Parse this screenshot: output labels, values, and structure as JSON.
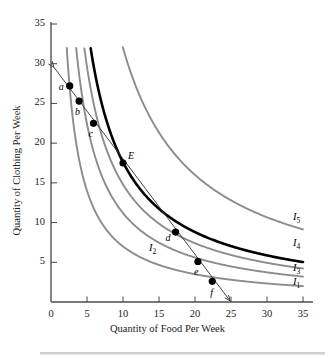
{
  "chart_data": {
    "type": "line",
    "title": "",
    "xlabel": "Quantity of Food Per Week",
    "ylabel": "Quantity of Clothing Per Week",
    "xlim": [
      0,
      35
    ],
    "ylim": [
      0,
      35
    ],
    "xticks": [
      0,
      5,
      10,
      15,
      20,
      25,
      30,
      35
    ],
    "yticks": [
      5,
      10,
      15,
      20,
      25,
      30,
      35
    ],
    "grid": false,
    "legend_position": "right-inline",
    "series": [
      {
        "name": "I1",
        "label": "I",
        "subscript": "1",
        "color": "#8c8c8c",
        "style": "solid",
        "width": 1.9,
        "utility_k": 70,
        "label_x": 33.6,
        "label_y": 2.3
      },
      {
        "name": "I2",
        "label": "I",
        "subscript": "2",
        "color": "#8c8c8c",
        "style": "solid",
        "width": 1.9,
        "utility_k": 112,
        "label_x": 13.6,
        "label_y": 6.6
      },
      {
        "name": "I3",
        "label": "I",
        "subscript": "3",
        "color": "#8c8c8c",
        "style": "solid",
        "width": 1.9,
        "utility_k": 148,
        "label_x": 33.6,
        "label_y": 4.0
      },
      {
        "name": "I4",
        "label": "I",
        "subscript": "4",
        "color": "#000000",
        "style": "solid",
        "width": 2.6,
        "utility_k": 176,
        "label_x": 33.6,
        "label_y": 7.2
      },
      {
        "name": "I5",
        "label": "I",
        "subscript": "5",
        "color": "#8c8c8c",
        "style": "solid",
        "width": 1.9,
        "utility_k": 320,
        "label_x": 33.6,
        "label_y": 10.4
      }
    ],
    "budget_line": {
      "name": "budget-line",
      "color": "#3a3a3a",
      "x_intercept": 25,
      "y_intercept": 30,
      "arrow_both_ends": true
    },
    "points": [
      {
        "label": "a",
        "x": 2.6,
        "y": 27.2,
        "label_dx": -11,
        "label_dy": 1
      },
      {
        "label": "b",
        "x": 3.9,
        "y": 25.3,
        "label_dx": -4,
        "label_dy": 11
      },
      {
        "label": "c",
        "x": 5.9,
        "y": 22.5,
        "label_dx": -5,
        "label_dy": 11
      },
      {
        "label": "E",
        "x": 10.0,
        "y": 17.5,
        "label_dx": 5,
        "label_dy": -7
      },
      {
        "label": "d",
        "x": 17.3,
        "y": 8.8,
        "label_dx": -10,
        "label_dy": 6
      },
      {
        "label": "e",
        "x": 20.4,
        "y": 5.1,
        "label_dx": -4,
        "label_dy": 11
      },
      {
        "label": "f",
        "x": 22.4,
        "y": 2.6,
        "label_dx": -2,
        "label_dy": 12
      }
    ]
  },
  "axes": {
    "x_tick_labels": [
      "0",
      "5",
      "10",
      "15",
      "20",
      "25",
      "30",
      "35"
    ],
    "y_tick_labels": [
      "5",
      "10",
      "15",
      "20",
      "25",
      "30",
      "35"
    ],
    "x_axis_title": "Quantity of Food Per Week",
    "y_axis_title": "Quantity of Clothing Per Week"
  }
}
